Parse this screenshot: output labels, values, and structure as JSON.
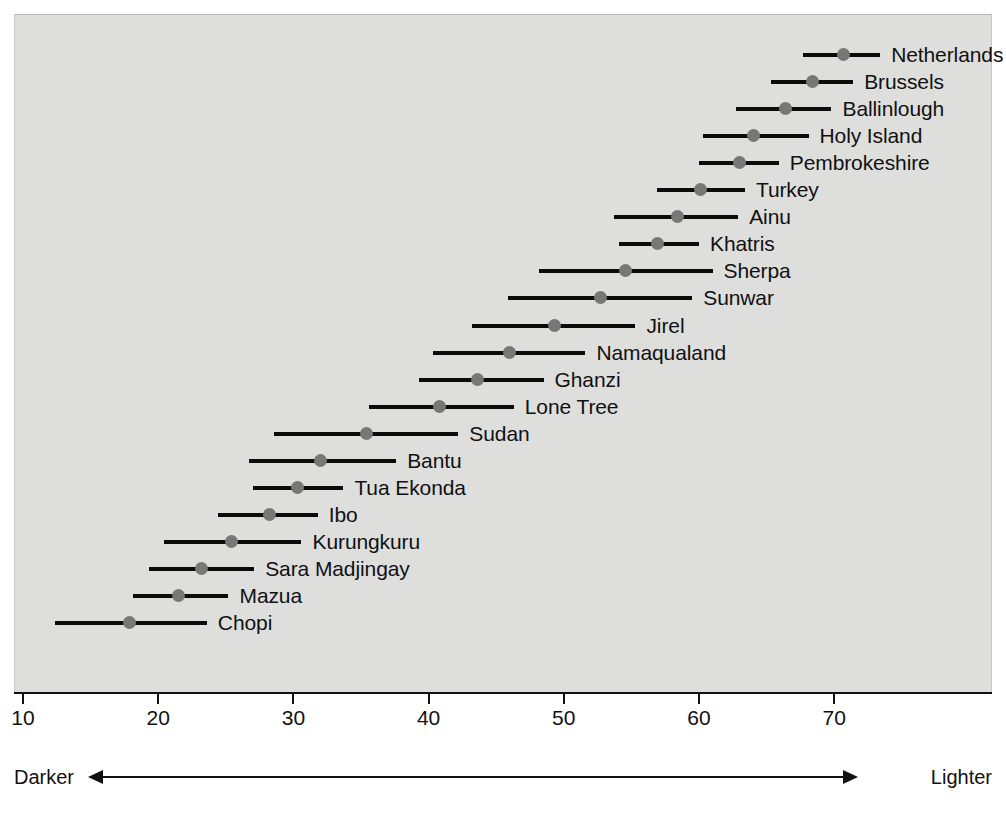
{
  "chart_data": {
    "type": "scatter",
    "title": "",
    "subtitle": "",
    "xlabel": "",
    "ylabel": "",
    "xlim": [
      8.5,
      75.5
    ],
    "grid": false,
    "legend": "none",
    "orientation": "horizontal",
    "marker": "circle with range line (low - mean - high)",
    "x_ticks": [
      10,
      20,
      30,
      40,
      50,
      60,
      70
    ],
    "x_tick_labels": [
      "10",
      "20",
      "30",
      "40",
      "50",
      "60",
      "70"
    ],
    "direction_note": {
      "left": "Darker",
      "right": "Lighter"
    },
    "categories": [
      "Netherlands",
      "Brussels",
      "Ballinlough",
      "Holy Island",
      "Pembrokeshire",
      "Turkey",
      "Ainu",
      "Khatris",
      "Sherpa",
      "Sunwar",
      "Jirel",
      "Namaqualand",
      "Ghanzi",
      "Lone Tree",
      "Sudan",
      "Bantu",
      "Tua Ekonda",
      "Ibo",
      "Kurungkuru",
      "Sara Madjingay",
      "Mazua",
      "Chopi"
    ],
    "values": [
      70.7,
      68.4,
      66.4,
      64.0,
      63.0,
      60.1,
      58.4,
      56.9,
      54.6,
      52.7,
      49.3,
      46.0,
      43.6,
      40.8,
      35.4,
      32.0,
      30.3,
      28.2,
      25.4,
      23.2,
      21.5,
      17.9
    ],
    "low": [
      67.7,
      65.3,
      62.7,
      60.3,
      60.0,
      56.9,
      53.7,
      54.1,
      48.2,
      45.9,
      43.2,
      40.3,
      39.3,
      35.6,
      28.6,
      26.7,
      27.0,
      24.4,
      20.4,
      19.3,
      18.1,
      12.4
    ],
    "high": [
      73.4,
      71.4,
      69.8,
      68.1,
      65.9,
      63.4,
      62.9,
      60.0,
      61.0,
      59.5,
      55.3,
      51.6,
      48.5,
      46.3,
      42.2,
      37.6,
      33.7,
      31.8,
      30.6,
      27.1,
      25.2,
      23.6
    ],
    "points": [
      {
        "label": "Netherlands",
        "low": 67.7,
        "value": 70.7,
        "high": 73.4
      },
      {
        "label": "Brussels",
        "low": 65.3,
        "value": 68.4,
        "high": 71.4
      },
      {
        "label": "Ballinlough",
        "low": 62.7,
        "value": 66.4,
        "high": 69.8
      },
      {
        "label": "Holy Island",
        "low": 60.3,
        "value": 64.0,
        "high": 68.1
      },
      {
        "label": "Pembrokeshire",
        "low": 60.0,
        "value": 63.0,
        "high": 65.9
      },
      {
        "label": "Turkey",
        "low": 56.9,
        "value": 60.1,
        "high": 63.4
      },
      {
        "label": "Ainu",
        "low": 53.7,
        "value": 58.4,
        "high": 62.9
      },
      {
        "label": "Khatris",
        "low": 54.1,
        "value": 56.9,
        "high": 60.0
      },
      {
        "label": "Sherpa",
        "low": 48.2,
        "value": 54.6,
        "high": 61.0
      },
      {
        "label": "Sunwar",
        "low": 45.9,
        "value": 52.7,
        "high": 59.5
      },
      {
        "label": "Jirel",
        "low": 43.2,
        "value": 49.3,
        "high": 55.3
      },
      {
        "label": "Namaqualand",
        "low": 40.3,
        "value": 46.0,
        "high": 51.6
      },
      {
        "label": "Ghanzi",
        "low": 39.3,
        "value": 43.6,
        "high": 48.5
      },
      {
        "label": "Lone Tree",
        "low": 35.6,
        "value": 40.8,
        "high": 46.3
      },
      {
        "label": "Sudan",
        "low": 28.6,
        "value": 35.4,
        "high": 42.2
      },
      {
        "label": "Bantu",
        "low": 26.7,
        "value": 32.0,
        "high": 37.6
      },
      {
        "label": "Tua Ekonda",
        "low": 27.0,
        "value": 30.3,
        "high": 33.7
      },
      {
        "label": "Ibo",
        "low": 24.4,
        "value": 28.2,
        "high": 31.8
      },
      {
        "label": "Kurungkuru",
        "low": 20.4,
        "value": 25.4,
        "high": 30.6
      },
      {
        "label": "Sara Madjingay",
        "low": 19.3,
        "value": 23.2,
        "high": 27.1
      },
      {
        "label": "Mazua",
        "low": 18.1,
        "value": 21.5,
        "high": 25.2
      },
      {
        "label": "Chopi",
        "low": 12.4,
        "value": 17.9,
        "high": 23.6
      }
    ]
  },
  "colors": {
    "panel_background": "#dededd",
    "page_background": "#ffffff",
    "line": "#0b0b0b",
    "marker": "#777776",
    "text": "#111111"
  }
}
